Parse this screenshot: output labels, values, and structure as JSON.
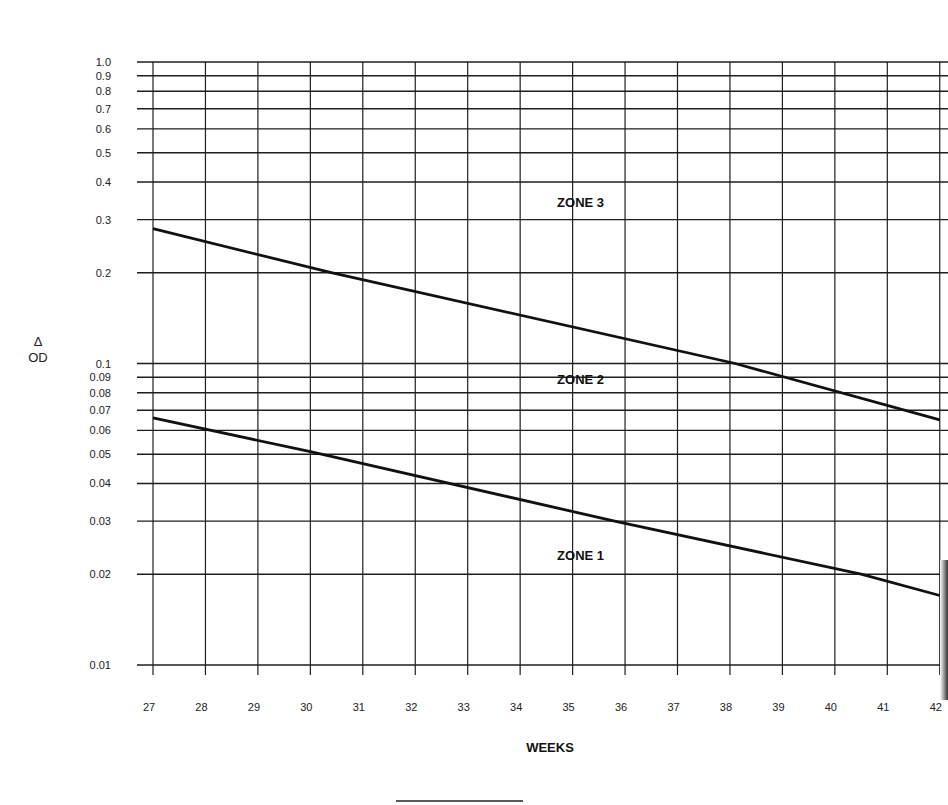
{
  "chart_data": {
    "type": "line",
    "title": "",
    "xlabel": "WEEKS",
    "ylabel": "Δ OD",
    "ylabel_lines": [
      "Δ",
      "OD"
    ],
    "yscale": "log",
    "ylim": [
      0.01,
      1.0
    ],
    "xlim": [
      27,
      42
    ],
    "grid": true,
    "x_ticks": [
      27,
      28,
      29,
      30,
      31,
      32,
      33,
      34,
      35,
      36,
      37,
      38,
      39,
      40,
      41,
      42
    ],
    "x_tick_labels": [
      "27",
      "28",
      "29",
      "30",
      "31",
      "32",
      "33",
      "34",
      "35",
      "36",
      "37",
      "38",
      "39",
      "40",
      "41",
      "42"
    ],
    "y_ticks": [
      1.0,
      0.9,
      0.8,
      0.7,
      0.6,
      0.5,
      0.4,
      0.3,
      0.2,
      0.1,
      0.09,
      0.08,
      0.07,
      0.06,
      0.05,
      0.04,
      0.03,
      0.02,
      0.01
    ],
    "y_tick_labels": [
      "1.0",
      "0.9",
      "0.8",
      "0.7",
      "0.6",
      "0.5",
      "0.4",
      "0.3",
      "0.2",
      "0.1",
      "0.09",
      "0.08",
      "0.07",
      "0.06",
      "0.05",
      "0.04",
      "0.03",
      "0.02",
      "0.01"
    ],
    "series": [
      {
        "name": "Zone 2/3 boundary",
        "x": [
          27,
          30.4,
          38.1,
          42
        ],
        "y": [
          0.28,
          0.2,
          0.1,
          0.065
        ]
      },
      {
        "name": "Zone 1/2 boundary",
        "x": [
          27,
          30,
          35.8,
          40.5,
          42
        ],
        "y": [
          0.066,
          0.051,
          0.03,
          0.02,
          0.017
        ]
      }
    ],
    "annotations": [
      {
        "text": "ZONE 3",
        "x": 35.2,
        "y": 0.34
      },
      {
        "text": "ZONE 2",
        "x": 35.2,
        "y": 0.088
      },
      {
        "text": "ZONE 1",
        "x": 35.2,
        "y": 0.023
      }
    ],
    "legend": "none"
  }
}
